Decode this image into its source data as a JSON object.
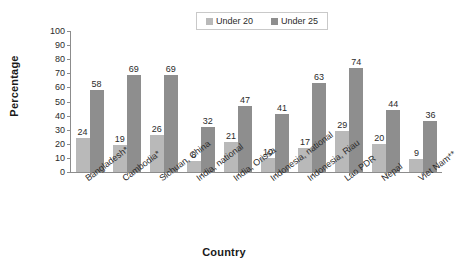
{
  "chart_data": {
    "type": "bar",
    "title": "",
    "xlabel": "Country",
    "ylabel": "Percentage",
    "ylim": [
      0,
      100
    ],
    "ytick_step": 10,
    "yticks": [
      100,
      90,
      80,
      70,
      60,
      50,
      40,
      30,
      20,
      10,
      0
    ],
    "grid": false,
    "legend_position": "top-center",
    "categories": [
      "Bangladesh*",
      "Cambodia*",
      "Sichuan, China",
      "India, national",
      "India, Orissa",
      "Indonesia, national",
      "Indonesia, Riau",
      "Lao PDR",
      "Nepal",
      "Viet Nam**"
    ],
    "series": [
      {
        "name": "Under 20",
        "color": "#b9b9b9",
        "values": [
          24,
          19,
          26,
          8,
          21,
          10,
          17,
          29,
          20,
          9
        ]
      },
      {
        "name": "Under 25",
        "color": "#8e8e8e",
        "values": [
          58,
          69,
          69,
          32,
          47,
          41,
          63,
          74,
          44,
          36
        ]
      }
    ]
  },
  "legend": {
    "entries": [
      {
        "label": "Under 20",
        "color": "#b9b9b9"
      },
      {
        "label": "Under 25",
        "color": "#8e8e8e"
      }
    ]
  },
  "axes": {
    "y_title": "Percentage",
    "x_title": "Country"
  }
}
